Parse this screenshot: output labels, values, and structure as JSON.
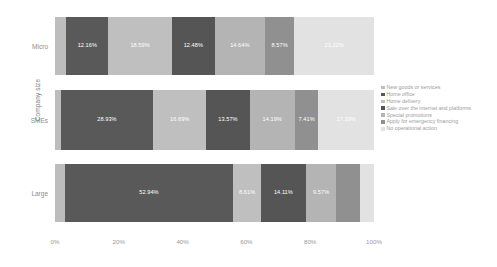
{
  "chart_data": {
    "type": "bar",
    "subtype": "horizontal-100-percent-stacked",
    "title": "",
    "xlabel": "",
    "ylabel": "Company size",
    "xlim": [
      0,
      100
    ],
    "grid": false,
    "legend_position": "right",
    "categories": [
      "Micro",
      "SMEs",
      "Large"
    ],
    "x_ticks": [
      "0%",
      "20%",
      "40%",
      "60%",
      "80%",
      "100%"
    ],
    "x_tick_values": [
      0,
      20,
      40,
      60,
      80,
      100
    ],
    "series": [
      {
        "name": "New goods or services",
        "color": "#bdbdbd",
        "values": [
          3.34,
          1.82,
          3.0
        ],
        "labels": [
          "",
          "",
          ""
        ]
      },
      {
        "name": "Home office",
        "color": "#595959",
        "values": [
          12.16,
          28.93,
          52.94
        ],
        "labels": [
          "12.16%",
          "28.93%",
          "52.94%"
        ]
      },
      {
        "name": "Home delivery",
        "color": "#bfbfbf",
        "values": [
          18.59,
          16.69,
          8.61
        ],
        "labels": [
          "18.59%",
          "16.69%",
          "8.61%"
        ]
      },
      {
        "name": "Sale over the internet and platforms",
        "color": "#555555",
        "values": [
          12.48,
          13.57,
          14.11
        ],
        "labels": [
          "12.48%",
          "13.57%",
          "14.11%"
        ]
      },
      {
        "name": "Special promotions",
        "color": "#b4b4b4",
        "values": [
          14.64,
          14.19,
          9.57
        ],
        "labels": [
          "14.64%",
          "14.19%",
          "9.57%"
        ]
      },
      {
        "name": "Apply for emergency financing",
        "color": "#909090",
        "values": [
          8.57,
          7.41,
          7.47
        ],
        "labels": [
          "8.57%",
          "7.41%",
          ""
        ]
      },
      {
        "name": "No operational action",
        "color": "#e2e2e2",
        "values": [
          23.22,
          17.39,
          4.3
        ],
        "labels": [
          "23.22%",
          "17.39%",
          ""
        ]
      }
    ]
  },
  "axis": {
    "y_title": "Company size"
  }
}
